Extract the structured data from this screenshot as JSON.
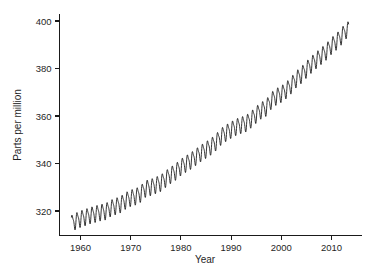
{
  "chart_data": {
    "type": "line",
    "title": "",
    "subtitle": "",
    "xlabel": "Year",
    "ylabel": "Parts per million",
    "xlim": [
      1956.5,
      2013.5
    ],
    "ylim": [
      310.0,
      403.0
    ],
    "xticks": [
      1960,
      1970,
      1980,
      1990,
      2000,
      2010
    ],
    "xticklabels": [
      "1960",
      "1970",
      "1980",
      "1990",
      "2000",
      "2010"
    ],
    "yticks": [
      320,
      340,
      360,
      380,
      400
    ],
    "yticklabels": [
      "320",
      "340",
      "360",
      "380",
      "400"
    ],
    "grid": false,
    "legend": null,
    "annotations": [],
    "line_color": "#111111",
    "background_color": "#ffffff",
    "series": [
      {
        "name": "Atmospheric CO2 concentration",
        "description": "Monthly mean with seasonal oscillation superimposed on rising trend",
        "seasonal_amplitude_ppm": 3.1,
        "x": [
          1958.2,
          1959.0,
          1960.0,
          1961.0,
          1962.0,
          1963.0,
          1964.0,
          1965.0,
          1966.0,
          1967.0,
          1968.0,
          1969.0,
          1970.0,
          1971.0,
          1972.0,
          1973.0,
          1974.0,
          1975.0,
          1976.0,
          1977.0,
          1978.0,
          1979.0,
          1980.0,
          1981.0,
          1982.0,
          1983.0,
          1984.0,
          1985.0,
          1986.0,
          1987.0,
          1988.0,
          1989.0,
          1990.0,
          1991.0,
          1992.0,
          1993.0,
          1994.0,
          1995.0,
          1996.0,
          1997.0,
          1998.0,
          1999.0,
          2000.0,
          2001.0,
          2002.0,
          2003.0,
          2004.0,
          2005.0,
          2006.0,
          2007.0,
          2008.0,
          2009.0,
          2010.0,
          2011.0,
          2012.0,
          2013.0
        ],
        "annual_mean_ppm": [
          315.0,
          315.9,
          316.9,
          317.6,
          318.4,
          319.0,
          319.6,
          320.0,
          321.4,
          322.2,
          323.0,
          324.6,
          325.7,
          326.3,
          327.5,
          329.7,
          330.2,
          331.1,
          332.0,
          333.8,
          335.4,
          336.8,
          338.7,
          340.1,
          341.4,
          343.0,
          344.6,
          346.0,
          347.4,
          349.2,
          351.6,
          353.1,
          354.4,
          355.6,
          356.4,
          357.1,
          358.8,
          360.8,
          362.6,
          363.7,
          366.7,
          368.4,
          369.5,
          371.1,
          373.2,
          375.8,
          377.5,
          379.8,
          381.9,
          383.8,
          385.6,
          387.4,
          389.8,
          391.6,
          393.8,
          396.5
        ]
      }
    ],
    "data_source_label": ""
  },
  "axes": {
    "x_title": "Year",
    "y_title": "Parts per million"
  }
}
